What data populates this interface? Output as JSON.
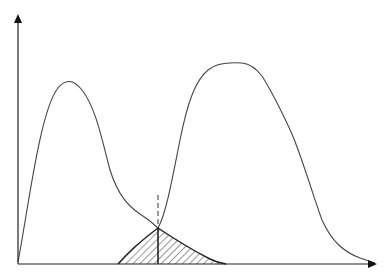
{
  "diagram": {
    "title": "",
    "type": "overlapping-distributions",
    "axes": {
      "x_label": "",
      "y_label": "",
      "origin": [
        18,
        264
      ],
      "x_end": [
        375,
        264
      ],
      "y_end": [
        18,
        16
      ]
    },
    "curves": [
      {
        "name": "left-distribution",
        "peak": [
          70,
          82
        ]
      },
      {
        "name": "right-distribution",
        "peak": [
          235,
          63
        ]
      }
    ],
    "intersection": {
      "x": 158,
      "y": 228
    },
    "threshold_line": {
      "x": 158,
      "y_top": 195,
      "y_bottom": 264,
      "style": "dashed-above-intersection"
    },
    "overlap_region": {
      "x_start": 118,
      "x_end": 226,
      "fill": "hatched"
    },
    "colors": {
      "stroke": "#333333",
      "axis": "#222222",
      "hatch": "#333333",
      "background": "#ffffff"
    }
  }
}
